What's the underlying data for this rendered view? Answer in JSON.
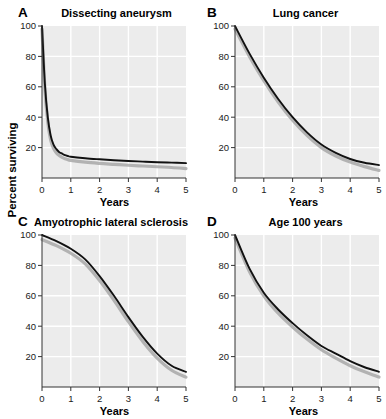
{
  "figure": {
    "ylabel": "Percent surviving",
    "xlabel": "Years",
    "background": "#ffffff",
    "plot_background": "#ececec",
    "gridline_color": "#ffffff",
    "curve_color": "#111111",
    "band_color": "#a8a8a8"
  },
  "panels": [
    {
      "letter": "A",
      "title": "Dissecting aneurysm",
      "xlabel": "Years",
      "x_ticks": [
        "0",
        "1",
        "2",
        "3",
        "4",
        "5"
      ],
      "y_ticks": [
        "20",
        "40",
        "60",
        "80",
        "100"
      ]
    },
    {
      "letter": "B",
      "title": "Lung cancer",
      "xlabel": "Years",
      "x_ticks": [
        "0",
        "1",
        "2",
        "3",
        "4",
        "5"
      ],
      "y_ticks": [
        "20",
        "40",
        "60",
        "80",
        "100"
      ]
    },
    {
      "letter": "C",
      "title": "Amyotrophic lateral sclerosis",
      "xlabel": "Years",
      "x_ticks": [
        "0",
        "1",
        "2",
        "3",
        "4",
        "5"
      ],
      "y_ticks": [
        "20",
        "40",
        "60",
        "80",
        "100"
      ]
    },
    {
      "letter": "D",
      "title": "Age 100 years",
      "xlabel": "Years",
      "x_ticks": [
        "0",
        "1",
        "2",
        "3",
        "4",
        "5"
      ],
      "y_ticks": [
        "20",
        "40",
        "60",
        "80",
        "100"
      ]
    }
  ],
  "chart_data": [
    {
      "type": "line",
      "panel": "A",
      "title": "Dissecting aneurysm",
      "xlabel": "Years",
      "ylabel": "Percent surviving",
      "xlim": [
        0,
        5
      ],
      "ylim": [
        0,
        100
      ],
      "xticks": [
        0,
        1,
        2,
        3,
        4,
        5
      ],
      "yticks": [
        20,
        40,
        60,
        80,
        100
      ],
      "grid": true,
      "legend": "none",
      "series": [
        {
          "name": "survival",
          "x": [
            0,
            0.1,
            0.2,
            0.3,
            0.4,
            0.5,
            0.6,
            0.7,
            0.8,
            0.9,
            1.0,
            1.5,
            2.0,
            2.5,
            3.0,
            3.5,
            4.0,
            4.5,
            5.0
          ],
          "values": [
            100,
            62,
            40,
            28,
            22,
            19,
            17,
            16,
            15,
            14.5,
            14,
            13,
            12.3,
            11.7,
            11.2,
            10.8,
            10.4,
            10.1,
            9.8
          ]
        },
        {
          "name": "confidence-band",
          "x": [
            0,
            0.1,
            0.2,
            0.3,
            0.4,
            0.5,
            0.6,
            0.7,
            0.8,
            0.9,
            1.0,
            1.5,
            2.0,
            2.5,
            3.0,
            3.5,
            4.0,
            4.5,
            5.0
          ],
          "values": [
            98,
            59,
            37,
            25,
            19.5,
            16.5,
            14.8,
            13.6,
            12.7,
            12.1,
            11.6,
            10.4,
            9.6,
            9.0,
            8.4,
            7.9,
            7.4,
            6.9,
            6.2
          ]
        }
      ]
    },
    {
      "type": "line",
      "panel": "B",
      "title": "Lung cancer",
      "xlabel": "Years",
      "ylabel": "Percent surviving",
      "xlim": [
        0,
        5
      ],
      "ylim": [
        0,
        100
      ],
      "xticks": [
        0,
        1,
        2,
        3,
        4,
        5
      ],
      "yticks": [
        20,
        40,
        60,
        80,
        100
      ],
      "grid": true,
      "legend": "none",
      "series": [
        {
          "name": "survival",
          "x": [
            0,
            0.5,
            1.0,
            1.5,
            2.0,
            2.5,
            3.0,
            3.5,
            4.0,
            4.5,
            5.0
          ],
          "values": [
            100,
            82,
            66,
            52,
            40,
            30,
            22,
            16.5,
            12.5,
            10,
            8.5
          ]
        },
        {
          "name": "confidence-band",
          "x": [
            0,
            0.5,
            1.0,
            1.5,
            2.0,
            2.5,
            3.0,
            3.5,
            4.0,
            4.5,
            5.0
          ],
          "values": [
            98,
            80,
            64,
            50,
            38,
            28,
            20,
            14.5,
            10.5,
            7.5,
            5.0
          ]
        }
      ]
    },
    {
      "type": "line",
      "panel": "C",
      "title": "Amyotrophic lateral sclerosis",
      "xlabel": "Years",
      "ylabel": "Percent surviving",
      "xlim": [
        0,
        5
      ],
      "ylim": [
        0,
        100
      ],
      "xticks": [
        0,
        1,
        2,
        3,
        4,
        5
      ],
      "yticks": [
        20,
        40,
        60,
        80,
        100
      ],
      "grid": true,
      "legend": "none",
      "series": [
        {
          "name": "survival",
          "x": [
            0,
            0.5,
            1.0,
            1.5,
            2.0,
            2.5,
            3.0,
            3.5,
            4.0,
            4.5,
            5.0
          ],
          "values": [
            100,
            96,
            91,
            84,
            73,
            60,
            46,
            33,
            22,
            14,
            10
          ]
        },
        {
          "name": "confidence-band",
          "x": [
            0,
            0.5,
            1.0,
            1.5,
            2.0,
            2.5,
            3.0,
            3.5,
            4.0,
            4.5,
            5.0
          ],
          "values": [
            97,
            93,
            88,
            81,
            70,
            57,
            43,
            30,
            19,
            11,
            6.5
          ]
        }
      ]
    },
    {
      "type": "line",
      "panel": "D",
      "title": "Age 100 years",
      "xlabel": "Years",
      "ylabel": "Percent surviving",
      "xlim": [
        0,
        5
      ],
      "ylim": [
        0,
        100
      ],
      "xticks": [
        0,
        1,
        2,
        3,
        4,
        5
      ],
      "yticks": [
        20,
        40,
        60,
        80,
        100
      ],
      "grid": true,
      "legend": "none",
      "series": [
        {
          "name": "survival",
          "x": [
            0,
            0.5,
            1.0,
            1.5,
            2.0,
            2.5,
            3.0,
            3.5,
            4.0,
            4.5,
            5.0
          ],
          "values": [
            100,
            78,
            62,
            51,
            42,
            34,
            27,
            22,
            17,
            13,
            10
          ]
        },
        {
          "name": "confidence-band",
          "x": [
            0,
            0.5,
            1.0,
            1.5,
            2.0,
            2.5,
            3.0,
            3.5,
            4.0,
            4.5,
            5.0
          ],
          "values": [
            98,
            76,
            60,
            48.5,
            39.5,
            31.5,
            24.5,
            19,
            14,
            10,
            6.5
          ]
        }
      ]
    }
  ]
}
